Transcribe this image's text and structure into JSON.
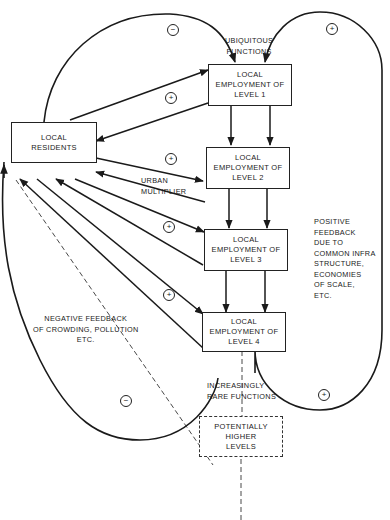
{
  "diagram": {
    "nodes": {
      "residents": {
        "label": "LOCAL\nRESIDENTS"
      },
      "level1": {
        "label": "LOCAL\nEMPLOYMENT OF\nLEVEL 1"
      },
      "level2": {
        "label": "LOCAL\nEMPLOYMENT OF\nLEVEL 2"
      },
      "level3": {
        "label": "LOCAL\nEMPLOYMENT OF\nLEVEL 3"
      },
      "level4": {
        "label": "LOCAL\nEMPLOYMENT OF\nLEVEL 4"
      },
      "higher": {
        "label": "POTENTIALLY\nHIGHER\nLEVELS"
      }
    },
    "annotations": {
      "ubiquitous": "UBIQUITOUS\nFUNCTIONS",
      "urban_multiplier": "URBAN\nMULTIPLIER",
      "positive_feedback": "POSITIVE\nFEEDBACK\nDUE TO\nCOMMON INFRA\nSTRUCTURE,\nECONOMIES\nOF SCALE,\nETC.",
      "negative_feedback": "NEGATIVE FEEDBACK\nOF CROWDING, POLLUTION\nETC.",
      "rare_functions": "INCREASINGLY\nRARE FUNCTIONS"
    },
    "loop_signs": {
      "top_left_negative": "−",
      "top_right_positive": "+",
      "level1_loop": "+",
      "level2_loop": "+",
      "level3_loop": "+",
      "level4_loop": "+",
      "bottom_left_negative": "−",
      "bottom_right_positive": "+"
    },
    "edges": [
      {
        "from": "residents",
        "to": "level1",
        "type": "arrow"
      },
      {
        "from": "level1",
        "to": "residents",
        "type": "arrow"
      },
      {
        "from": "residents",
        "to": "level2",
        "type": "arrow"
      },
      {
        "from": "level2",
        "to": "residents",
        "type": "arrow"
      },
      {
        "from": "residents",
        "to": "level3",
        "type": "arrow"
      },
      {
        "from": "level3",
        "to": "residents",
        "type": "arrow"
      },
      {
        "from": "residents",
        "to": "level4",
        "type": "arrow"
      },
      {
        "from": "level4",
        "to": "residents",
        "type": "arrow"
      },
      {
        "from": "level1",
        "to": "level2",
        "type": "double-arrow"
      },
      {
        "from": "level2",
        "to": "level3",
        "type": "double-arrow"
      },
      {
        "from": "level3",
        "to": "level4",
        "type": "double-arrow"
      },
      {
        "from": "level4",
        "to": "higher",
        "type": "dashed"
      },
      {
        "from": "residents",
        "to": "higher",
        "type": "dashed"
      },
      {
        "from": "higher",
        "to": "below",
        "type": "dashed"
      }
    ]
  }
}
